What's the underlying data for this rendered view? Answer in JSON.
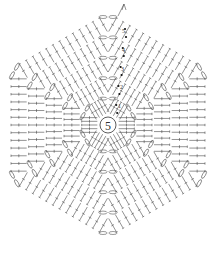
{
  "diagram": {
    "type": "crochet-chart",
    "shape": "hexagon",
    "center_label": "5",
    "row_labels": [
      "1",
      "2",
      "3",
      "4",
      "5"
    ],
    "rows": 5,
    "sides": 6,
    "colors": {
      "line": "#4a4a4a",
      "background": "#ffffff",
      "marker": "#111111"
    }
  }
}
